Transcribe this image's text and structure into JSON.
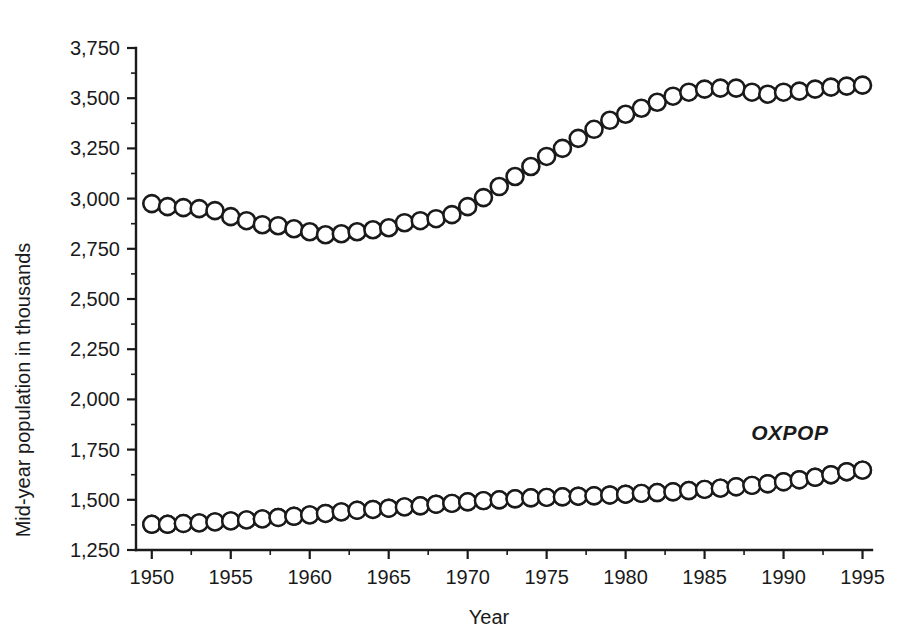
{
  "chart_data": {
    "type": "line",
    "title": "",
    "xlabel": "Year",
    "ylabel": "Mid-year population in thousands",
    "xlim": [
      1949,
      1995.6
    ],
    "ylim": [
      1250,
      3750
    ],
    "xticks": [
      1950,
      1955,
      1960,
      1965,
      1970,
      1975,
      1980,
      1985,
      1990,
      1995
    ],
    "xtick_labels": [
      "1950",
      "1955",
      "1960",
      "1965",
      "1970",
      "1975",
      "1980",
      "1985",
      "1990",
      "1995"
    ],
    "yticks": [
      1250,
      1500,
      1750,
      2000,
      2250,
      2500,
      2750,
      3000,
      3250,
      3500,
      3750
    ],
    "ytick_labels": [
      "1,250",
      "1,500",
      "1,750",
      "2,000",
      "2,250",
      "2,500",
      "2,750",
      "3,000",
      "3,250",
      "3,500",
      "3,750"
    ],
    "minor_ticks_per_interval": 1,
    "grid": false,
    "legend_position": "inline-annotation",
    "annotations": [
      {
        "text": "OXPOP",
        "x": 1990.4,
        "y": 1800,
        "style": "italic"
      }
    ],
    "x": [
      1950,
      1951,
      1952,
      1953,
      1954,
      1955,
      1956,
      1957,
      1958,
      1959,
      1960,
      1961,
      1962,
      1963,
      1964,
      1965,
      1966,
      1967,
      1968,
      1969,
      1970,
      1971,
      1972,
      1973,
      1974,
      1975,
      1976,
      1977,
      1978,
      1979,
      1980,
      1981,
      1982,
      1983,
      1984,
      1985,
      1986,
      1987,
      1988,
      1989,
      1990,
      1991,
      1992,
      1993,
      1994,
      1995
    ],
    "series": [
      {
        "name": "upper-series",
        "marker": "open-circle",
        "values": [
          2975,
          2960,
          2955,
          2950,
          2940,
          2910,
          2890,
          2870,
          2865,
          2850,
          2835,
          2820,
          2825,
          2835,
          2845,
          2855,
          2880,
          2890,
          2900,
          2920,
          2960,
          3005,
          3060,
          3110,
          3160,
          3210,
          3250,
          3300,
          3345,
          3390,
          3420,
          3450,
          3480,
          3510,
          3530,
          3545,
          3550,
          3550,
          3530,
          3520,
          3530,
          3535,
          3545,
          3555,
          3560,
          3565
        ]
      },
      {
        "name": "OXPOP",
        "marker": "half-filled-circle",
        "values": [
          1378,
          1378,
          1382,
          1385,
          1390,
          1395,
          1400,
          1405,
          1412,
          1418,
          1425,
          1432,
          1440,
          1448,
          1452,
          1458,
          1465,
          1470,
          1478,
          1482,
          1490,
          1496,
          1500,
          1505,
          1510,
          1512,
          1515,
          1518,
          1520,
          1524,
          1528,
          1532,
          1536,
          1540,
          1546,
          1552,
          1558,
          1565,
          1572,
          1580,
          1590,
          1600,
          1612,
          1625,
          1640,
          1648
        ]
      }
    ]
  }
}
